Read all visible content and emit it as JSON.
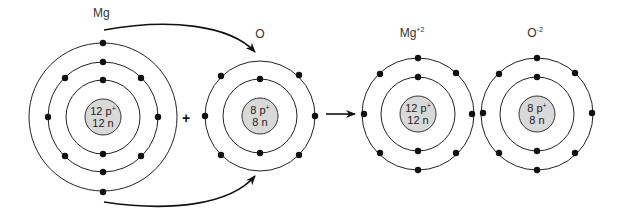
{
  "diagram": {
    "plus_sign": "+",
    "atoms": [
      {
        "id": "mg",
        "label": "Mg",
        "label_sup": "",
        "center": [
          103,
          117
        ],
        "nucleus": {
          "protons_text": "12 p",
          "proton_sup": "+",
          "neutrons_text": "12 n",
          "radius": 18
        },
        "shells": [
          {
            "radius": 37,
            "electrons": 2
          },
          {
            "radius": 55,
            "electrons": 8
          },
          {
            "radius": 74,
            "electrons": 2
          }
        ]
      },
      {
        "id": "o",
        "label": "O",
        "label_sup": "",
        "center": [
          260,
          116
        ],
        "nucleus": {
          "protons_text": "8 p",
          "proton_sup": "+",
          "neutrons_text": "8 n",
          "radius": 18
        },
        "shells": [
          {
            "radius": 37,
            "electrons": 2
          },
          {
            "radius": 55,
            "electrons": 6
          }
        ]
      },
      {
        "id": "mg-ion",
        "label": "Mg",
        "label_sup": "+2",
        "center": [
          418,
          114
        ],
        "nucleus": {
          "protons_text": "12 p",
          "proton_sup": "+",
          "neutrons_text": "12 n",
          "radius": 18
        },
        "shells": [
          {
            "radius": 37,
            "electrons": 2
          },
          {
            "radius": 56,
            "electrons": 8
          }
        ]
      },
      {
        "id": "o-ion",
        "label": "O",
        "label_sup": "-2",
        "center": [
          537,
          114
        ],
        "nucleus": {
          "protons_text": "8 p",
          "proton_sup": "+",
          "neutrons_text": "8 n",
          "radius": 18
        },
        "shells": [
          {
            "radius": 37,
            "electrons": 2
          },
          {
            "radius": 56,
            "electrons": 8
          }
        ]
      }
    ],
    "arrows": [
      {
        "id": "electron-transfer-top",
        "description": "Mg outer electron to O"
      },
      {
        "id": "electron-transfer-bottom",
        "description": "Mg outer electron to O"
      },
      {
        "id": "reaction-arrow",
        "description": "reactants to products"
      }
    ],
    "colors": {
      "nucleus_fill": "#d9d9d9",
      "line": "#222222",
      "electron": "#111111"
    }
  }
}
